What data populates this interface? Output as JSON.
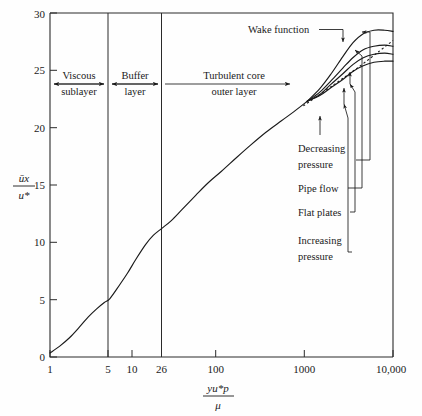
{
  "chart_data": {
    "type": "line",
    "title": "",
    "xlabel": "y u* rho / mu",
    "xlabel_numerator": "yu*p",
    "xlabel_denominator": "μ",
    "ylabel": "ūx / u*",
    "ylabel_numerator": "ūx",
    "ylabel_denominator": "u*",
    "xscale": "log",
    "xlim": [
      1,
      10000
    ],
    "ylim": [
      0,
      30
    ],
    "grid": false,
    "legend": "none",
    "xticks": [
      1,
      5,
      10,
      26,
      100,
      1000,
      10000
    ],
    "xtick_labels": [
      "1",
      "5",
      "10",
      "26",
      "100",
      "1000",
      "10,000"
    ],
    "yticks": [
      0,
      5,
      10,
      15,
      20,
      25,
      30
    ],
    "ytick_labels": [
      "0",
      "5",
      "10",
      "15",
      "20",
      "25",
      "30"
    ],
    "region_dividers": [
      5,
      26
    ],
    "regions": [
      {
        "name": "viscous-sublayer",
        "label_line1": "Viscous",
        "label_line2": "sublayer",
        "x_from": 1,
        "x_to": 5
      },
      {
        "name": "buffer-layer",
        "label_line1": "Buffer",
        "label_line2": "layer",
        "x_from": 5,
        "x_to": 26
      },
      {
        "name": "turbulent-core",
        "label_line1": "Turbulent core",
        "label_line2": "outer layer",
        "x_from": 26,
        "x_to": 1000
      }
    ],
    "series": [
      {
        "name": "viscous-and-log-core",
        "description": "common inner profile from wall through log region",
        "points": [
          [
            1,
            0.35
          ],
          [
            1.3,
            0.95
          ],
          [
            1.7,
            1.7
          ],
          [
            2.2,
            2.6
          ],
          [
            2.8,
            3.5
          ],
          [
            3.5,
            4.2
          ],
          [
            4.3,
            4.75
          ],
          [
            5,
            5.1
          ],
          [
            6.5,
            6.3
          ],
          [
            8,
            7.3
          ],
          [
            10,
            8.5
          ],
          [
            13,
            9.8
          ],
          [
            16,
            10.6
          ],
          [
            20,
            11.2
          ],
          [
            26,
            11.9
          ],
          [
            35,
            12.9
          ],
          [
            50,
            14.1
          ],
          [
            70,
            15.2
          ],
          [
            100,
            16.2
          ],
          [
            150,
            17.4
          ],
          [
            220,
            18.5
          ],
          [
            330,
            19.6
          ],
          [
            500,
            20.6
          ],
          [
            700,
            21.4
          ],
          [
            1000,
            22.3
          ]
        ]
      },
      {
        "name": "decreasing-pressure",
        "label": "Decreasing pressure",
        "points": [
          [
            1000,
            22.3
          ],
          [
            1400,
            23.4
          ],
          [
            1900,
            24.7
          ],
          [
            2600,
            26.2
          ],
          [
            3400,
            27.4
          ],
          [
            4500,
            28.2
          ],
          [
            6000,
            28.5
          ],
          [
            8000,
            28.5
          ],
          [
            10000,
            28.4
          ]
        ]
      },
      {
        "name": "pipe-flow",
        "label": "Pipe flow",
        "points": [
          [
            1000,
            22.3
          ],
          [
            1400,
            23.1
          ],
          [
            1900,
            24.1
          ],
          [
            2600,
            25.2
          ],
          [
            3400,
            26.1
          ],
          [
            4500,
            26.8
          ],
          [
            6000,
            27.1
          ],
          [
            8000,
            27.2
          ],
          [
            10000,
            27.1
          ]
        ]
      },
      {
        "name": "flat-plates",
        "label": "Flat plates",
        "points": [
          [
            1000,
            22.3
          ],
          [
            1400,
            22.9
          ],
          [
            1900,
            23.8
          ],
          [
            2600,
            24.7
          ],
          [
            3400,
            25.5
          ],
          [
            4500,
            26.1
          ],
          [
            6000,
            26.4
          ],
          [
            8000,
            26.5
          ],
          [
            10000,
            26.4
          ]
        ]
      },
      {
        "name": "increasing-pressure",
        "label": "Increasing pressure",
        "points": [
          [
            1000,
            22.3
          ],
          [
            1400,
            22.8
          ],
          [
            1900,
            23.5
          ],
          [
            2600,
            24.2
          ],
          [
            3400,
            24.9
          ],
          [
            4500,
            25.4
          ],
          [
            6000,
            25.7
          ],
          [
            8000,
            25.8
          ],
          [
            10000,
            25.8
          ]
        ]
      },
      {
        "name": "log-law-extrapolation",
        "style": "dashed",
        "points": [
          [
            900,
            21.9
          ],
          [
            2000,
            23.7
          ],
          [
            4000,
            25.3
          ],
          [
            7000,
            26.7
          ],
          [
            10000,
            27.6
          ]
        ]
      }
    ],
    "annotations": [
      {
        "name": "wake-function",
        "label": "Wake function",
        "points_to": "peak of decreasing-pressure curve"
      },
      {
        "name": "decreasing-pressure",
        "label_line1": "Decreasing",
        "label_line2": "pressure"
      },
      {
        "name": "pipe-flow",
        "label_line1": "Pipe flow",
        "label_line2": ""
      },
      {
        "name": "flat-plates",
        "label_line1": "Flat plates",
        "label_line2": ""
      },
      {
        "name": "increasing-pressure",
        "label_line1": "Increasing",
        "label_line2": "pressure"
      }
    ]
  }
}
